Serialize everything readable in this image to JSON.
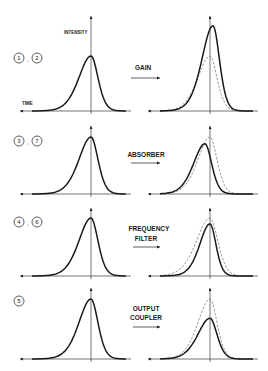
{
  "colors": {
    "ink": "#1a1a1a",
    "dashed": "#555555",
    "background": "#ffffff"
  },
  "axes": {
    "vertical_label": "INTENSITY",
    "horizontal_label": "TIME"
  },
  "rows": [
    {
      "steps": [
        "1",
        "2"
      ],
      "element": [
        "GAIN"
      ],
      "effect": "amplifies pulse; peak grows and shifts forward in time",
      "input_pulse": {
        "peak": 1.0,
        "shift": 0,
        "width": 1.0
      },
      "output_pulse": {
        "peak": 1.55,
        "shift": 3,
        "width": 0.92
      },
      "reference_dashed": {
        "peak": 1.0,
        "shift": 0,
        "width": 1.0
      }
    },
    {
      "steps": [
        "3",
        "7"
      ],
      "element": [
        "ABSORBER"
      ],
      "effect": "saturable absorber attenuates leading edge; peak lowered and shifted earlier",
      "input_pulse": {
        "peak": 1.0,
        "shift": 0,
        "width": 1.0
      },
      "output_pulse": {
        "peak": 0.88,
        "shift": -5,
        "width": 0.95
      },
      "reference_dashed": {
        "peak": 1.0,
        "shift": 0,
        "width": 1.0
      }
    },
    {
      "steps": [
        "4",
        "6"
      ],
      "element": [
        "FREQUENCY",
        "FILTER"
      ],
      "effect": "bandwidth limiting; pulse broadened slightly and peak reduced",
      "input_pulse": {
        "peak": 1.0,
        "shift": 0,
        "width": 1.0
      },
      "output_pulse": {
        "peak": 0.9,
        "shift": 0,
        "width": 0.85
      },
      "reference_dashed": {
        "peak": 1.0,
        "shift": 0,
        "width": 1.12
      }
    },
    {
      "steps": [
        "5"
      ],
      "element": [
        "OUTPUT",
        "COUPLER"
      ],
      "effect": "fraction of energy extracted; uniform intensity reduction",
      "input_pulse": {
        "peak": 1.0,
        "shift": 0,
        "width": 1.0
      },
      "output_pulse": {
        "peak": 0.68,
        "shift": 0,
        "width": 1.0
      },
      "reference_dashed": {
        "peak": 1.0,
        "shift": 0,
        "width": 1.0
      }
    }
  ]
}
